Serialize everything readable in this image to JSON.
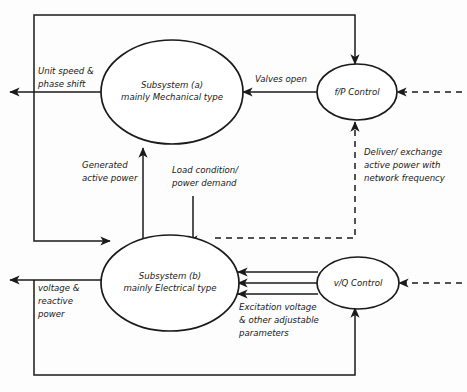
{
  "diagram": {
    "background_color": "#fdfdfd",
    "line_color": "#1a1a1a",
    "nodes": [
      {
        "id": "subsystem-a",
        "shape": "ellipse",
        "line1": "Subsystem (a)",
        "line2": "mainly Mechanical type"
      },
      {
        "id": "subsystem-b",
        "shape": "ellipse",
        "line1": "Subsystem (b)",
        "line2": "mainly Electrical type"
      },
      {
        "id": "fp-control",
        "shape": "ellipse",
        "line1": "f/P Control"
      },
      {
        "id": "vq-control",
        "shape": "ellipse",
        "line1": "v/Q Control"
      }
    ],
    "labels": {
      "unit_speed": {
        "line1": "Unit speed &",
        "line2": "phase shift"
      },
      "valves_open": {
        "line1": "Valves open"
      },
      "generated_active_power": {
        "line1": "Generated",
        "line2": "active power"
      },
      "load_condition": {
        "line1": "Load condition/",
        "line2": "power demand"
      },
      "deliver_exchange": {
        "line1": "Deliver/ exchange",
        "line2": "active power with",
        "line3": "network frequency"
      },
      "voltage_reactive": {
        "line1": "voltage &",
        "line2": "reactive",
        "line3": "power"
      },
      "excitation": {
        "line1": "Excitation voltage",
        "line2": "& other adjustable",
        "line3": "parameters"
      }
    }
  }
}
